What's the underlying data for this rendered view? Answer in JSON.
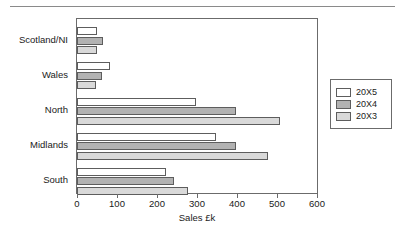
{
  "chart_data": {
    "type": "bar",
    "orientation": "horizontal",
    "title": "",
    "xlabel": "Sales  £k",
    "ylabel": "",
    "xlim": [
      0,
      600
    ],
    "xticks": [
      0,
      100,
      200,
      300,
      400,
      500,
      600
    ],
    "grid": false,
    "legend_position": "right",
    "categories": [
      "Scotland/NI",
      "Wales",
      "North",
      "Midlands",
      "South"
    ],
    "series": [
      {
        "name": "20X5",
        "color": "#ffffff",
        "values": [
          50,
          82,
          297,
          348,
          222
        ]
      },
      {
        "name": "20X4",
        "color": "#b2b2b2",
        "values": [
          65,
          62,
          398,
          398,
          243
        ]
      },
      {
        "name": "20X3",
        "color": "#d9d9d9",
        "values": [
          50,
          48,
          508,
          477,
          278
        ]
      }
    ]
  },
  "axis": {
    "tick_labels": [
      "0",
      "100",
      "200",
      "300",
      "400",
      "500",
      "600"
    ],
    "x_axis_title": "Sales  £k"
  },
  "legend": {
    "entries": [
      {
        "label": "20X5"
      },
      {
        "label": "20X4"
      },
      {
        "label": "20X3"
      }
    ]
  }
}
